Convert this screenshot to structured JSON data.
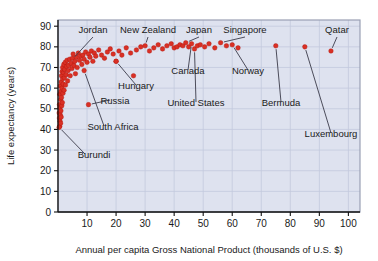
{
  "chart_data": {
    "type": "scatter",
    "title": "",
    "xlabel": "Annual per capita Gross National Product (thousands of U.S. $)",
    "ylabel": "Life expectancy (years)",
    "xlim": [
      0,
      104
    ],
    "ylim": [
      0,
      93
    ],
    "xticks": [
      10,
      20,
      30,
      40,
      50,
      60,
      70,
      80,
      90,
      100
    ],
    "yticks": [
      0,
      10,
      20,
      30,
      40,
      50,
      60,
      70,
      80,
      90
    ],
    "grid": true,
    "legend": "none",
    "marker_color": "#d93025",
    "plot_background": "#dee2ef",
    "series": [
      {
        "name": "Countries",
        "points": [
          [
            0.4,
            48.0
          ],
          [
            0.5,
            45.5
          ],
          [
            0.5,
            52.0
          ],
          [
            0.6,
            41.5
          ],
          [
            0.6,
            57.0
          ],
          [
            0.7,
            44.0
          ],
          [
            0.7,
            50.5
          ],
          [
            0.8,
            47.0
          ],
          [
            0.8,
            61.0
          ],
          [
            0.9,
            43.0
          ],
          [
            0.9,
            54.5
          ],
          [
            1.0,
            58.5
          ],
          [
            1.0,
            49.0
          ],
          [
            1.1,
            63.0
          ],
          [
            1.1,
            46.0
          ],
          [
            1.2,
            55.5
          ],
          [
            1.2,
            66.0
          ],
          [
            1.3,
            51.5
          ],
          [
            1.4,
            60.0
          ],
          [
            1.4,
            68.0
          ],
          [
            1.5,
            53.0
          ],
          [
            1.6,
            64.5
          ],
          [
            1.6,
            70.0
          ],
          [
            1.7,
            57.5
          ],
          [
            1.8,
            62.0
          ],
          [
            1.9,
            67.5
          ],
          [
            2.0,
            71.5
          ],
          [
            2.1,
            59.0
          ],
          [
            2.2,
            65.0
          ],
          [
            2.3,
            69.0
          ],
          [
            2.5,
            72.5
          ],
          [
            2.6,
            61.5
          ],
          [
            2.8,
            66.5
          ],
          [
            3.0,
            70.5
          ],
          [
            3.1,
            73.5
          ],
          [
            3.3,
            63.5
          ],
          [
            3.5,
            68.5
          ],
          [
            3.7,
            71.0
          ],
          [
            4.0,
            74.0
          ],
          [
            4.2,
            66.0
          ],
          [
            4.5,
            72.0
          ],
          [
            4.8,
            69.5
          ],
          [
            5.0,
            74.5
          ],
          [
            5.2,
            76.5
          ],
          [
            5.5,
            71.0
          ],
          [
            5.8,
            73.0
          ],
          [
            6.0,
            67.0
          ],
          [
            6.3,
            75.0
          ],
          [
            6.6,
            70.0
          ],
          [
            7.0,
            77.0
          ],
          [
            7.4,
            73.5
          ],
          [
            7.8,
            75.5
          ],
          [
            8.2,
            71.5
          ],
          [
            8.6,
            76.0
          ],
          [
            9.0,
            74.0
          ],
          [
            9.5,
            77.5
          ],
          [
            10.0,
            72.5
          ],
          [
            10.5,
            76.5
          ],
          [
            11.0,
            75.0
          ],
          [
            11.5,
            78.0
          ],
          [
            12.0,
            73.0
          ],
          [
            12.5,
            77.0
          ],
          [
            13.0,
            75.5
          ],
          [
            14.0,
            78.5
          ],
          [
            15.0,
            76.0
          ],
          [
            16.0,
            74.5
          ],
          [
            17.0,
            77.5
          ],
          [
            18.0,
            79.0
          ],
          [
            19.0,
            76.5
          ],
          [
            20.0,
            73.0
          ],
          [
            21.0,
            78.0
          ],
          [
            22.0,
            76.0
          ],
          [
            23.5,
            79.5
          ],
          [
            25.0,
            77.0
          ],
          [
            26.0,
            66.0
          ],
          [
            27.0,
            78.5
          ],
          [
            28.5,
            80.0
          ],
          [
            30.0,
            80.5
          ],
          [
            31.5,
            78.0
          ],
          [
            33.0,
            79.5
          ],
          [
            34.5,
            81.0
          ],
          [
            36.0,
            79.0
          ],
          [
            37.5,
            80.5
          ],
          [
            39.0,
            81.5
          ],
          [
            40.0,
            79.5
          ],
          [
            41.0,
            80.0
          ],
          [
            42.0,
            81.0
          ],
          [
            43.0,
            80.5
          ],
          [
            44.0,
            82.0
          ],
          [
            45.0,
            80.0
          ],
          [
            46.0,
            81.5
          ],
          [
            47.0,
            79.0
          ],
          [
            48.0,
            80.5
          ],
          [
            49.0,
            81.0
          ],
          [
            50.5,
            80.0
          ],
          [
            52.0,
            81.5
          ],
          [
            54.0,
            79.5
          ],
          [
            56.0,
            82.0
          ],
          [
            58.0,
            80.5
          ],
          [
            60.0,
            81.0
          ],
          [
            62.0,
            79.5
          ],
          [
            75.0,
            80.5
          ],
          [
            85.0,
            80.0
          ],
          [
            94.0,
            78.0
          ],
          [
            9.0,
            68.5
          ],
          [
            20.0,
            73.0
          ],
          [
            10.5,
            52.0
          ],
          [
            0.4,
            41.0
          ]
        ]
      }
    ],
    "annotations": [
      {
        "label": "Jordan",
        "point": [
          5.0,
          74.0
        ]
      },
      {
        "label": "New Zealand",
        "point": [
          30.0,
          80.5
        ]
      },
      {
        "label": "Japan",
        "point": [
          44.0,
          82.0
        ]
      },
      {
        "label": "Singapore",
        "point": [
          56.0,
          82.0
        ]
      },
      {
        "label": "Qatar",
        "point": [
          94.0,
          78.0
        ]
      },
      {
        "label": "Canada",
        "point": [
          46.0,
          81.5
        ]
      },
      {
        "label": "Norway",
        "point": [
          60.0,
          81.0
        ]
      },
      {
        "label": "Hungary",
        "point": [
          20.0,
          73.0
        ]
      },
      {
        "label": "United States",
        "point": [
          47.0,
          79.0
        ]
      },
      {
        "label": "Bermuda",
        "point": [
          75.0,
          80.5
        ]
      },
      {
        "label": "Luxembourg",
        "point": [
          85.0,
          80.0
        ]
      },
      {
        "label": "Russia",
        "point": [
          10.5,
          52.0
        ]
      },
      {
        "label": "South Africa",
        "point": [
          9.0,
          68.5
        ]
      },
      {
        "label": "Burundi",
        "point": [
          0.4,
          41.0
        ]
      }
    ]
  },
  "axis": {
    "xlabel": "Annual per capita Gross National Product (thousands of U.S. $)",
    "ylabel": "Life expectancy (years)"
  },
  "labels": {
    "jordan": "Jordan",
    "new_zealand": "New Zealand",
    "japan": "Japan",
    "singapore": "Singapore",
    "qatar": "Qatar",
    "canada": "Canada",
    "norway": "Norway",
    "hungary": "Hungary",
    "united_states": "United States",
    "bermuda": "Bermuda",
    "luxembourg": "Luxembourg",
    "russia": "Russia",
    "south_africa": "South Africa",
    "burundi": "Burundi"
  },
  "xticks": [
    "10",
    "20",
    "30",
    "40",
    "50",
    "60",
    "70",
    "80",
    "90",
    "100"
  ],
  "yticks": [
    "0",
    "10",
    "20",
    "30",
    "40",
    "50",
    "60",
    "70",
    "80",
    "90"
  ]
}
